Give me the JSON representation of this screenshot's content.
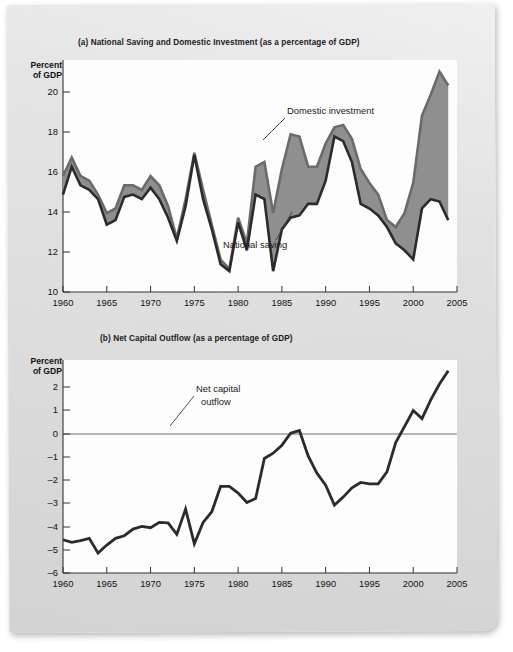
{
  "figure": {
    "panels": [
      {
        "id": "a",
        "title": "(a) National Saving and Domestic Investment (as a percentage of GDP)",
        "y_axis_label_line1": "Percent",
        "y_axis_label_line2": "of GDP",
        "y_ticks": [
          "20",
          "18",
          "16",
          "14",
          "12",
          "10"
        ],
        "x_ticks": [
          "1960",
          "1965",
          "1970",
          "1975",
          "1980",
          "1985",
          "1990",
          "1995",
          "2000",
          "2005"
        ],
        "annotations": [
          {
            "name": "domestic-investment",
            "label": "Domestic investment"
          },
          {
            "name": "national-saving",
            "label": "National saving"
          }
        ]
      },
      {
        "id": "b",
        "title": "(b) Net Capital Outflow (as a percentage of GDP)",
        "y_axis_label_line1": "Percent",
        "y_axis_label_line2": "of GDP",
        "y_ticks": [
          "2",
          "1",
          "0",
          "–1",
          "–2",
          "–3",
          "–4",
          "–5",
          "–6"
        ],
        "x_ticks": [
          "1960",
          "1965",
          "1970",
          "1975",
          "1980",
          "1985",
          "1990",
          "1995",
          "2000",
          "2005"
        ],
        "annotations": [
          {
            "name": "net-capital-outflow",
            "label_line1": "Net capital",
            "label_line2": "outflow"
          }
        ]
      }
    ],
    "colors": {
      "line_dark": "#2b2b2b",
      "fill_gray": "#8f8f8f",
      "saving_line": "#6b6b6b",
      "plot_background": "#fdfdfd",
      "page_background": "#e3e3e3"
    }
  },
  "chart_data": [
    {
      "type": "line",
      "panel": "a",
      "title": "(a) National Saving and Domestic Investment (as a percentage of GDP)",
      "xlabel": "",
      "ylabel": "Percent of GDP",
      "xlim": [
        1960,
        2005
      ],
      "ylim": [
        10,
        20
      ],
      "grid": false,
      "legend": "annotated inline",
      "x": [
        1960,
        1961,
        1962,
        1963,
        1964,
        1965,
        1966,
        1967,
        1968,
        1969,
        1970,
        1971,
        1972,
        1973,
        1974,
        1975,
        1976,
        1977,
        1978,
        1979,
        1980,
        1981,
        1982,
        1983,
        1984,
        1985,
        1986,
        1987,
        1988,
        1989,
        1990,
        1991,
        1992,
        1993,
        1994,
        1995,
        1996,
        1997,
        1998,
        1999,
        2000,
        2001,
        2002,
        2003,
        2004
      ],
      "series": [
        {
          "name": "Domestic investment",
          "values": [
            15.8,
            14.6,
            15.4,
            15.6,
            16.0,
            17.1,
            16.9,
            15.9,
            15.8,
            16.0,
            15.5,
            16.0,
            16.8,
            17.8,
            16.3,
            14.1,
            16.0,
            17.3,
            18.8,
            19.1,
            17.0,
            18.2,
            15.8,
            16.0,
            19.1,
            17.3,
            16.8,
            16.7,
            16.2,
            16.2,
            15.2,
            13.3,
            13.5,
            14.4,
            16.2,
            16.4,
            16.7,
            17.2,
            17.9,
            18.2,
            18.6,
            16.4,
            16.0,
            16.1,
            16.9
          ]
        },
        {
          "name": "National saving",
          "values": [
            15.0,
            14.2,
            15.0,
            15.2,
            15.8,
            16.6,
            16.4,
            15.4,
            15.4,
            15.6,
            15.0,
            15.4,
            16.3,
            17.7,
            16.0,
            14.0,
            15.6,
            17.1,
            18.6,
            19.0,
            16.8,
            17.9,
            14.6,
            14.4,
            16.6,
            14.7,
            13.2,
            13.3,
            14.6,
            14.6,
            13.6,
            12.9,
            12.8,
            13.4,
            14.7,
            15.3,
            15.8,
            16.9,
            17.2,
            16.6,
            15.3,
            12.4,
            11.5,
            10.5,
            11.1
          ]
        }
      ]
    },
    {
      "type": "line",
      "panel": "b",
      "title": "(b) Net Capital Outflow (as a percentage of GDP)",
      "xlabel": "",
      "ylabel": "Percent of GDP",
      "xlim": [
        1960,
        2005
      ],
      "ylim": [
        -6,
        2
      ],
      "grid": false,
      "zero_reference_line": 0,
      "x": [
        1960,
        1961,
        1962,
        1963,
        1964,
        1965,
        1966,
        1967,
        1968,
        1969,
        1970,
        1971,
        1972,
        1973,
        1974,
        1975,
        1976,
        1977,
        1978,
        1979,
        1980,
        1981,
        1982,
        1983,
        1984,
        1985,
        1986,
        1987,
        1988,
        1989,
        1990,
        1991,
        1992,
        1993,
        1994,
        1995,
        1996,
        1997,
        1998,
        1999,
        2000,
        2001,
        2002,
        2003,
        2004
      ],
      "series": [
        {
          "name": "Net capital outflow",
          "values": [
            0.75,
            0.85,
            0.78,
            0.7,
            1.25,
            0.95,
            0.7,
            0.6,
            0.35,
            0.25,
            0.3,
            0.1,
            0.12,
            0.55,
            -0.4,
            0.9,
            0.1,
            -0.3,
            -1.25,
            -1.25,
            -1.0,
            -0.65,
            -0.8,
            -2.3,
            -2.5,
            -2.8,
            -3.25,
            -3.35,
            -2.4,
            -1.75,
            -1.3,
            -0.55,
            -0.85,
            -1.2,
            -1.4,
            -1.35,
            -1.35,
            -1.8,
            -2.9,
            -3.5,
            -4.1,
            -3.8,
            -4.5,
            -5.1,
            -5.6
          ]
        }
      ]
    }
  ]
}
